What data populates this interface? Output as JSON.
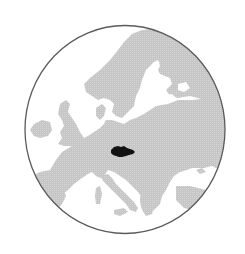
{
  "map": {
    "type": "locator-map",
    "region": "Europe",
    "highlighted_country": "Czech Republic",
    "colors": {
      "background": "#ffffff",
      "sea": "#ffffff",
      "land": "#c9c9c9",
      "highlight": "#111111",
      "globe_border": "#5a5a5a"
    }
  }
}
